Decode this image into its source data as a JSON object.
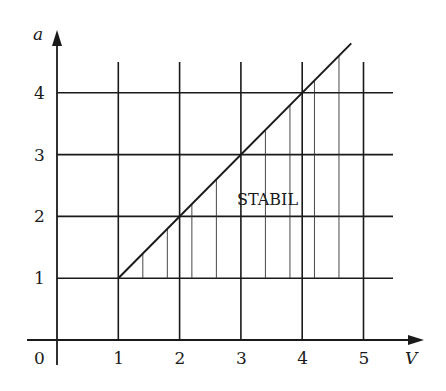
{
  "chart_data": {
    "type": "line",
    "title": "",
    "xlabel": "V",
    "ylabel": "a",
    "origin_label": "0",
    "x_ticks": [
      "1",
      "2",
      "3",
      "4",
      "5"
    ],
    "y_ticks": [
      "1",
      "2",
      "3",
      "4"
    ],
    "xlim": [
      0,
      5.6
    ],
    "ylim": [
      0,
      4.8
    ],
    "grid": true,
    "series": [
      {
        "name": "a = V",
        "x": [
          1,
          4.8
        ],
        "y": [
          1,
          4.8
        ]
      }
    ],
    "shaded_region": {
      "label": "STABIL",
      "description": "region below line a = V and above a = 1, hatched with vertical lines",
      "hatch_x": [
        1.4,
        1.8,
        2.2,
        2.6,
        3.4,
        3.8,
        4.2,
        4.6
      ]
    },
    "annotations": [
      {
        "text": "STABIL",
        "x": 3.6,
        "y": 2.2
      }
    ]
  },
  "colors": {
    "ink": "#1a1a1a",
    "background": "#ffffff"
  }
}
